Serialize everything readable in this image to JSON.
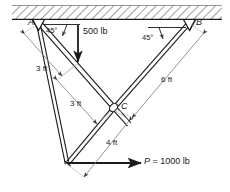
{
  "figure": {
    "background_color": "#ffffff",
    "ink_color": "#1a1a1a",
    "dim_line_color": "#8a8a8a",
    "hatch_color": "#4d4d4d"
  },
  "labels": {
    "point_a": "A",
    "point_b": "B",
    "point_c": "C",
    "angle_left": "45°",
    "angle_right": "45°",
    "load_vertical": "500 lb",
    "dim_a_to_load": "3 ft",
    "dim_load_to_c": "3 ft",
    "dim_b_to_c": "6 ft",
    "dim_c_to_bottom": "4 ft",
    "force_p_symbol": "P",
    "force_p_equals": "=",
    "force_p_value": "1000 lb"
  },
  "geometry": {
    "support_a": {
      "x": 38,
      "y": 22
    },
    "support_b": {
      "x": 190,
      "y": 22
    },
    "joint_c": {
      "x": 113,
      "y": 107
    },
    "bottom_vertex": {
      "x": 67,
      "y": 163
    },
    "load_point_500": {
      "x": 78,
      "y": 62
    },
    "ceiling": {
      "x1": 12,
      "x2": 222,
      "top": 5,
      "bottom": 19
    }
  },
  "icons": {
    "pin_support": "pin-support-icon",
    "ground_hatch": "ground-hatch-icon",
    "arrow_down": "arrow-down-icon",
    "arrow_right": "arrow-right-icon"
  }
}
